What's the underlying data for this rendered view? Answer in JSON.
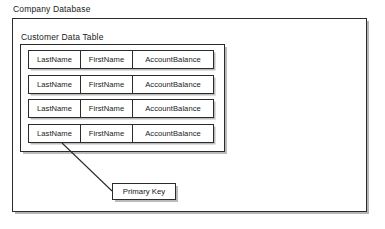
{
  "diagram": {
    "database": {
      "title": "Company Database"
    },
    "table": {
      "title": "Customer Data Table",
      "columns": [
        "LastName",
        "FirstName",
        "AccountBalance"
      ],
      "rows": [
        [
          "LastName",
          "FirstName",
          "AccountBalance"
        ],
        [
          "LastName",
          "FirstName",
          "AccountBalance"
        ],
        [
          "LastName",
          "FirstName",
          "AccountBalance"
        ],
        [
          "LastName",
          "FirstName",
          "AccountBalance"
        ]
      ]
    },
    "annotation": {
      "label": "Primary Key",
      "points_to": "LastName"
    },
    "colors": {
      "border": "#2b2b2b",
      "text": "#1a1a1a",
      "fill": "#ffffff",
      "shadow": "#787878"
    }
  }
}
